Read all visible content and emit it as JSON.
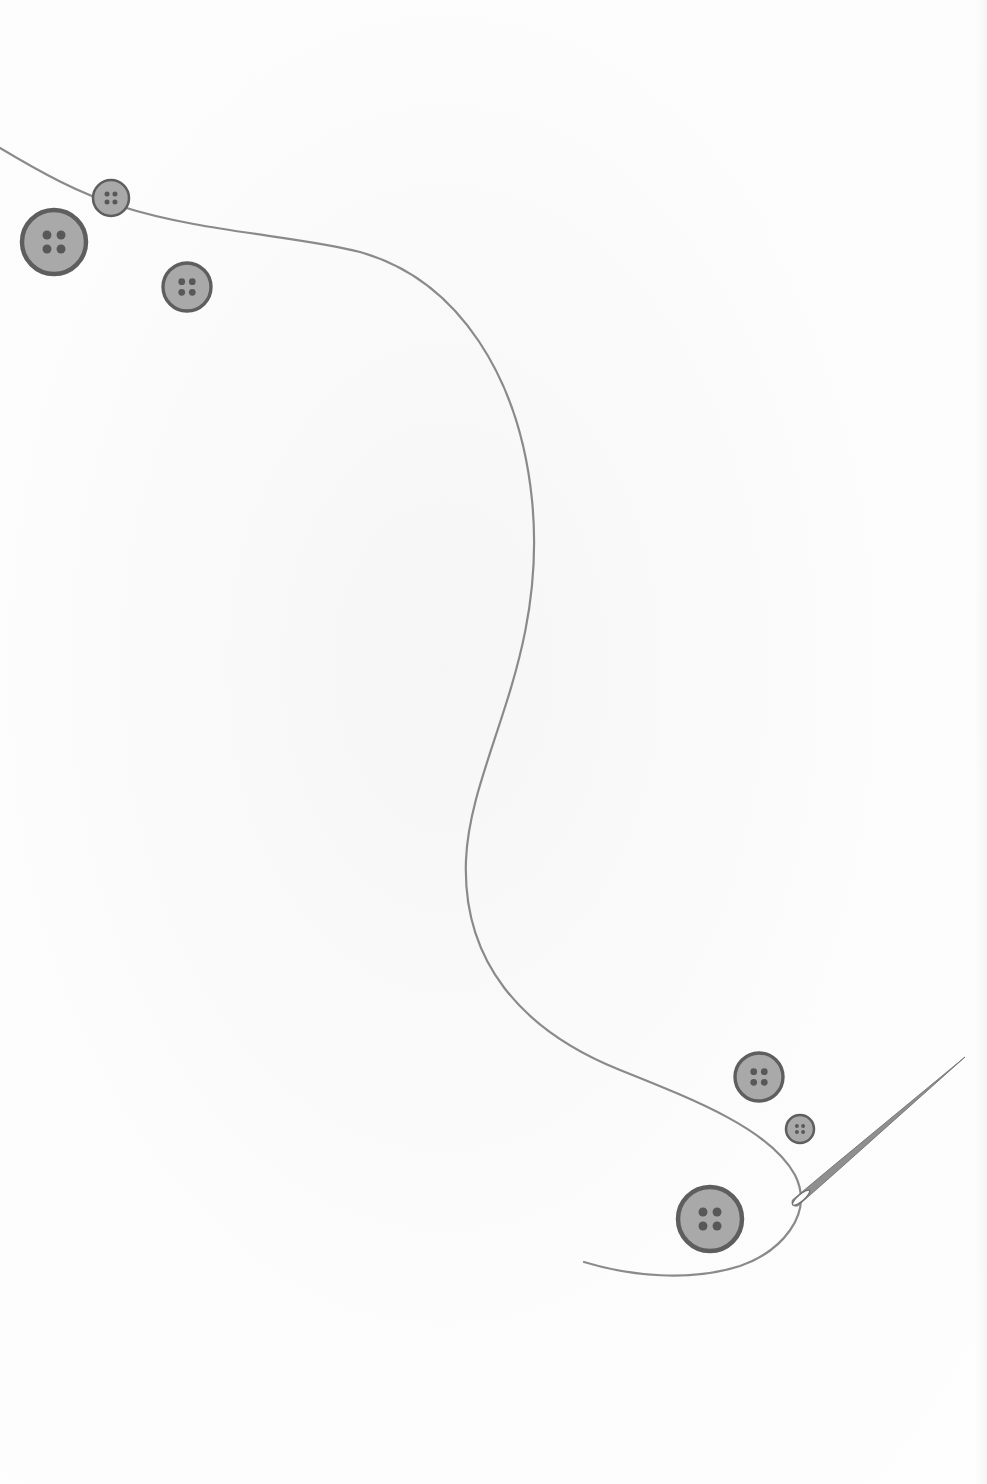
{
  "page": {
    "width": 987,
    "height": 1484,
    "background": "#fdfdfd"
  },
  "colors": {
    "thread": "#8a8a8a",
    "button_fill": "#a9a9a9",
    "button_rim": "#5e5e5e",
    "button_hole": "#585858",
    "needle": "#8f8f8f",
    "needle_dark": "#6f6f6f"
  },
  "thread": {
    "path": "M0,148 C40,172 80,194 120,206 C200,232 300,236 360,252 C460,280 520,380 532,500 C548,660 470,760 466,860 C462,960 520,1030 620,1070 C700,1102 770,1130 795,1175 C815,1215 780,1252 740,1266 C690,1282 630,1276 584,1262"
  },
  "buttons": [
    {
      "id": "button-small-top",
      "cx": 111,
      "cy": 198,
      "r": 18
    },
    {
      "id": "button-large-top",
      "cx": 54,
      "cy": 242,
      "r": 32
    },
    {
      "id": "button-medium-top",
      "cx": 187,
      "cy": 287,
      "r": 24
    },
    {
      "id": "button-medium-bottom",
      "cx": 759,
      "cy": 1077,
      "r": 24
    },
    {
      "id": "button-tiny-bottom",
      "cx": 800,
      "cy": 1129,
      "r": 14
    },
    {
      "id": "button-large-bottom",
      "cx": 710,
      "cy": 1219,
      "r": 32
    }
  ],
  "needle": {
    "eye_x": 795,
    "eye_y": 1203,
    "tip_x": 965,
    "tip_y": 1057
  }
}
